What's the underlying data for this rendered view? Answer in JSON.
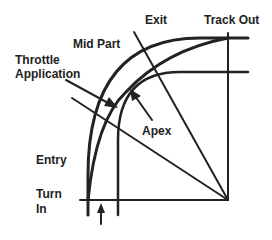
{
  "diagram": {
    "type": "racing-line-corner",
    "labels": {
      "exit": "Exit",
      "track_out": "Track Out",
      "mid_part": "Mid Part",
      "throttle_line1": "Throttle",
      "throttle_line2": "Application",
      "apex": "Apex",
      "entry": "Entry",
      "turn_in_line1": "Turn",
      "turn_in_line2": "In"
    },
    "colors": {
      "stroke": "#222222",
      "background": "#ffffff"
    }
  }
}
